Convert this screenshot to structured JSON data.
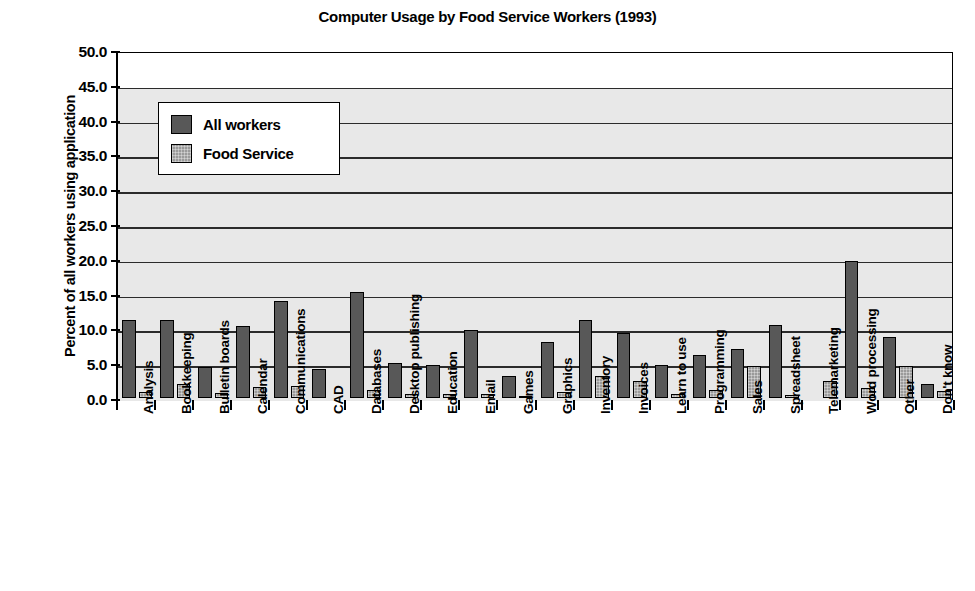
{
  "chart_data": {
    "type": "bar",
    "title": "Computer Usage by Food Service Workers (1993)",
    "xlabel": "",
    "ylabel": "Percent of all workers using application",
    "ylim": [
      0,
      50
    ],
    "ytick_step": 5,
    "ytick_labels": [
      "0.0",
      "5.0",
      "10.0",
      "15.0",
      "20.0",
      "25.0",
      "30.0",
      "35.0",
      "40.0",
      "45.0",
      "50.0"
    ],
    "grid": true,
    "legend_position": "upper-left-inside",
    "categories": [
      "Analysis",
      "Bookkeeping",
      "Bulletin boards",
      "Calendar",
      "Communications",
      "CAD",
      "Databases",
      "Desktop publishing",
      "Education",
      "Email",
      "Games",
      "Graphics",
      "Inventory",
      "Invoices",
      "Learn to use",
      "Programming",
      "Sales",
      "Spreadsheet",
      "Telemarketing",
      "Word processing",
      "Other",
      "Don't know"
    ],
    "series": [
      {
        "name": "All workers",
        "color": "#585858",
        "values": [
          11.2,
          11.2,
          4.4,
          10.3,
          13.9,
          4.2,
          15.2,
          5.1,
          4.7,
          9.8,
          3.1,
          8.0,
          11.2,
          9.3,
          4.8,
          6.2,
          7.1,
          10.5,
          0.0,
          19.7,
          8.7,
          2.0
        ]
      },
      {
        "name": "Food Service",
        "color": "#9a9a9a",
        "values": [
          0.8,
          2.0,
          0.7,
          1.6,
          1.7,
          0.0,
          1.2,
          0.6,
          0.6,
          0.6,
          0.3,
          0.8,
          3.2,
          2.5,
          0.6,
          1.1,
          4.6,
          0.4,
          2.5,
          1.5,
          4.6,
          1.0
        ]
      }
    ]
  },
  "legend": {
    "items": [
      {
        "label": "All workers"
      },
      {
        "label": "Food Service"
      }
    ]
  }
}
